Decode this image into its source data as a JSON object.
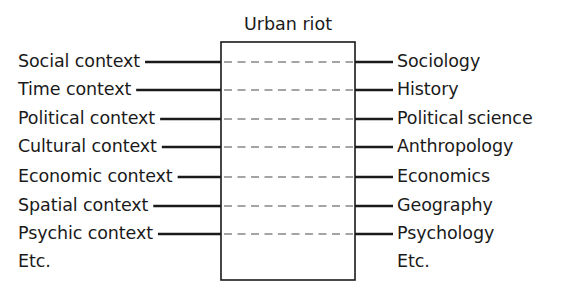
{
  "figure": {
    "title": "Urban riot",
    "box": {
      "x": 221,
      "y": 42,
      "width": 134,
      "height": 238
    },
    "row_ys": [
      62,
      90,
      119,
      147,
      177,
      206,
      234
    ],
    "etc_y": 262,
    "left_connector_end_x": 221,
    "right_connector_start_x": 355,
    "right_connector_end_x": 393,
    "left_label_x": 18,
    "right_label_x": 397,
    "stroke_color": "#1a1a1a",
    "dash_color": "#4a4a4a",
    "background": "#ffffff"
  },
  "rows": [
    {
      "left": "Social context",
      "right": "Sociology"
    },
    {
      "left": "Time context",
      "right": "History"
    },
    {
      "left": "Political context",
      "right": "Political science"
    },
    {
      "left": "Cultural context",
      "right": "Anthropology"
    },
    {
      "left": "Economic context",
      "right": "Economics"
    },
    {
      "left": "Spatial context",
      "right": "Geography"
    },
    {
      "left": "Psychic context",
      "right": "Psychology"
    }
  ],
  "etc": {
    "left": "Etc.",
    "right": "Etc."
  }
}
